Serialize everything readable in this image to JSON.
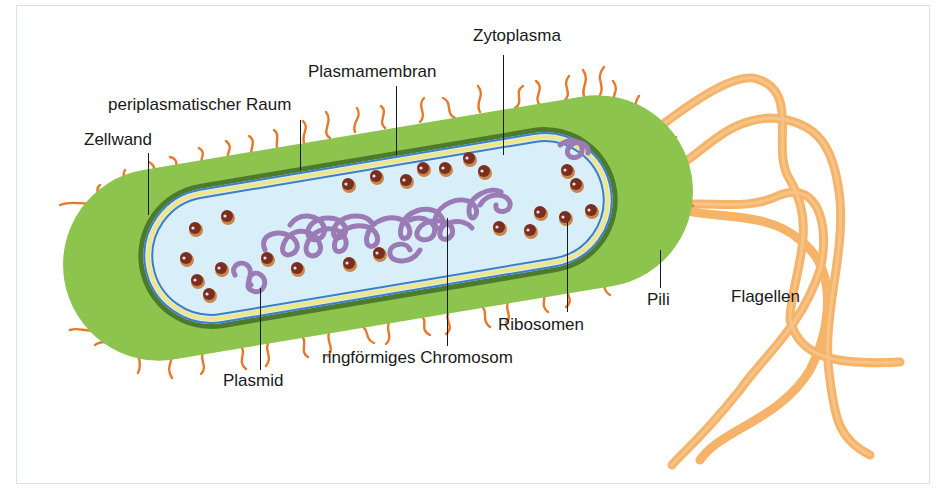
{
  "diagram": {
    "labels": {
      "zellwand": "Zellwand",
      "periplasma": "periplasmatischer Raum",
      "plasmamembran": "Plasmamembran",
      "zytoplasma": "Zytoplasma",
      "plasmid": "Plasmid",
      "chromosom": "ringförmiges Chromosom",
      "ribosomen": "Ribosomen",
      "pili": "Pili",
      "flagellen": "Flagellen"
    },
    "colors": {
      "cell_wall": "#8dc44e",
      "cell_wall_dark": "#4e7a2c",
      "membrane_blue": "#3c7fc4",
      "periplasm_yellow": "#efe68a",
      "cytoplasm": "#d8eef8",
      "chromosome": "#9a7bb5",
      "ribosome": "#7a2e1f",
      "ribosome_rim": "#c8874a",
      "pili": "#e8782a",
      "flagella": "#f5b46a",
      "frame": "#cfe8e6"
    }
  }
}
